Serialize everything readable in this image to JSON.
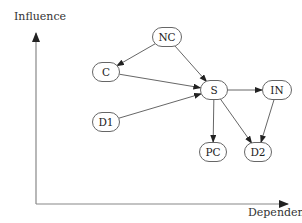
{
  "axes": {
    "y_label": "Influence",
    "x_label": "Dependence"
  },
  "nodes": [
    {
      "id": "NC",
      "label": "NC",
      "x": 167,
      "y": 37,
      "w": 30
    },
    {
      "id": "C",
      "label": "C",
      "x": 106,
      "y": 72,
      "w": 28
    },
    {
      "id": "S",
      "label": "S",
      "x": 214,
      "y": 90,
      "w": 28
    },
    {
      "id": "IN",
      "label": "IN",
      "x": 277,
      "y": 90,
      "w": 30
    },
    {
      "id": "D1",
      "label": "D1",
      "x": 106,
      "y": 122,
      "w": 28
    },
    {
      "id": "PC",
      "label": "PC",
      "x": 213,
      "y": 152,
      "w": 28
    },
    {
      "id": "D2",
      "label": "D2",
      "x": 258,
      "y": 152,
      "w": 28
    }
  ],
  "edges": [
    {
      "from": "NC",
      "to": "C"
    },
    {
      "from": "NC",
      "to": "S"
    },
    {
      "from": "C",
      "to": "S"
    },
    {
      "from": "D1",
      "to": "S"
    },
    {
      "from": "S",
      "to": "IN"
    },
    {
      "from": "S",
      "to": "PC"
    },
    {
      "from": "S",
      "to": "D2"
    },
    {
      "from": "IN",
      "to": "D2"
    }
  ],
  "colors": {
    "line": "#555555",
    "node_border": "#666666"
  }
}
